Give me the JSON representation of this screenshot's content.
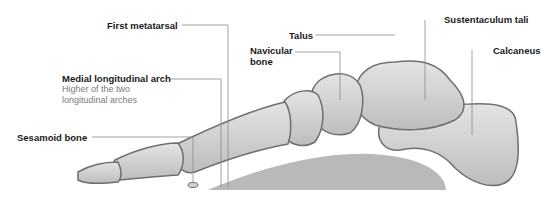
{
  "diagram": {
    "labels": {
      "first_metatarsal": "First metatarsal",
      "medial_arch": "Medial longitudinal arch",
      "medial_arch_desc_1": "Higher of the two",
      "medial_arch_desc_2": "longitudinal arches",
      "sesamoid": "Sesamoid bone",
      "talus": "Talus",
      "navicular_1": "Navicular",
      "navicular_2": "bone",
      "sustentaculum": "Sustentaculum tali",
      "calcaneus": "Calcaneus"
    },
    "colors": {
      "bone_fill": "#d6d6d6",
      "bone_outline": "#6e6e6e",
      "arch_fill": "#b9b9b9",
      "leader_line": "#8a8a8a",
      "label_text": "#1a1a1a",
      "desc_text": "#7a7a7a"
    }
  }
}
